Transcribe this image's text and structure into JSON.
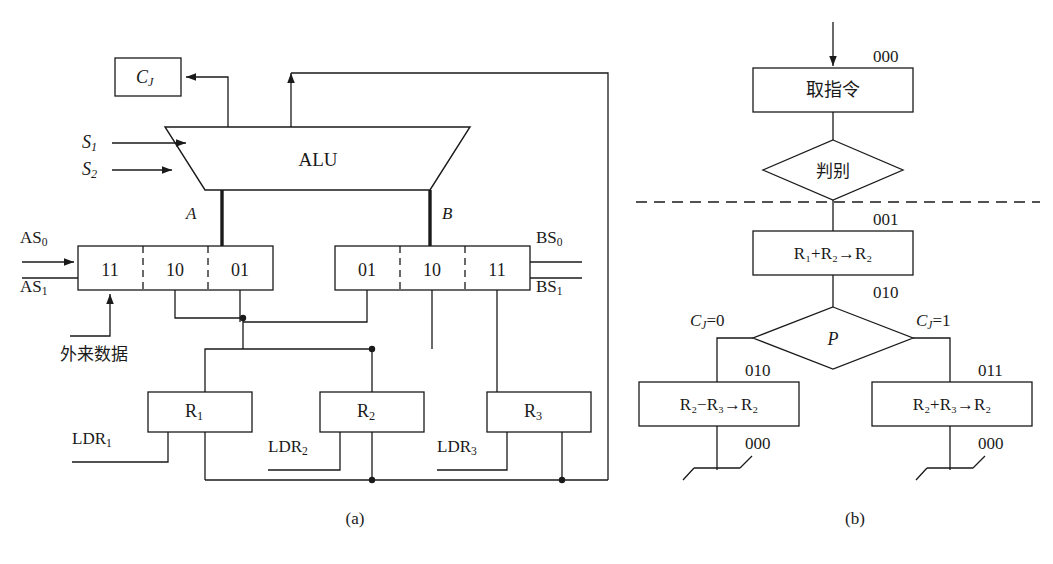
{
  "figure": {
    "caption_a": "(a)",
    "caption_b": "(b)"
  },
  "datapath": {
    "alu_label": "ALU",
    "cj_box_label": "C",
    "cj_box_sub": "J",
    "control_inputs": [
      {
        "name": "S",
        "sub": "1"
      },
      {
        "name": "S",
        "sub": "2"
      }
    ],
    "bus_a_label": "A",
    "bus_b_label": "B",
    "mux_left": {
      "cells": [
        "11",
        "10",
        "01"
      ],
      "select_inputs": [
        {
          "name": "AS",
          "sub": "0"
        },
        {
          "name": "AS",
          "sub": "1"
        }
      ]
    },
    "mux_right": {
      "cells": [
        "01",
        "10",
        "11"
      ],
      "select_inputs": [
        {
          "name": "BS",
          "sub": "0"
        },
        {
          "name": "BS",
          "sub": "1"
        }
      ]
    },
    "external_data_label": "外来数据",
    "registers": [
      {
        "name": "R",
        "sub": "1",
        "load": "LDR",
        "load_sub": "1"
      },
      {
        "name": "R",
        "sub": "2",
        "load": "LDR",
        "load_sub": "2"
      },
      {
        "name": "R",
        "sub": "3",
        "load": "LDR",
        "load_sub": "3"
      }
    ]
  },
  "flowchart": {
    "nodes": [
      {
        "id": "fetch",
        "kind": "process",
        "text": "取指令",
        "addr_top": "000"
      },
      {
        "id": "discriminate",
        "kind": "decision",
        "text": "判别"
      },
      {
        "id": "add12",
        "kind": "process",
        "text": "R₁+R₂→R₂",
        "addr_top": "001",
        "addr_bottom": "010"
      },
      {
        "id": "ptest",
        "kind": "decision",
        "text": "P"
      },
      {
        "id": "sub23",
        "kind": "process",
        "text": "R₂−R₃→R₂",
        "addr_top": "010",
        "addr_bottom": "000"
      },
      {
        "id": "add23",
        "kind": "process",
        "text": "R₂+R₃→R₂",
        "addr_top": "011",
        "addr_bottom": "000"
      }
    ],
    "branch_left_label": {
      "name": "C",
      "sub": "J",
      "value": "=0"
    },
    "branch_right_label": {
      "name": "C",
      "sub": "J",
      "value": "=1"
    },
    "separator": "dashed"
  },
  "colors": {
    "line": "#1a1a1a",
    "background": "#ffffff"
  }
}
